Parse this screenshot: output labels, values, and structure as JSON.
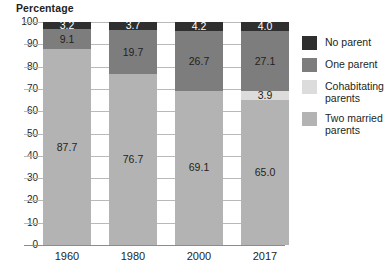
{
  "chart_data": {
    "type": "bar",
    "subtype": "stacked-100",
    "title": "Percentage",
    "xlabel": "",
    "ylabel": "",
    "ylim": [
      0,
      100
    ],
    "yticks": [
      0,
      10,
      20,
      30,
      40,
      50,
      60,
      70,
      80,
      90,
      100
    ],
    "ytick_labels": [
      "0",
      "10",
      "20",
      "30",
      "40",
      "50",
      "60",
      "70",
      "80",
      "90",
      "100"
    ],
    "grid": true,
    "legend_position": "right",
    "categories": [
      "1960",
      "1980",
      "2000",
      "2017"
    ],
    "series": [
      {
        "name": "No parent",
        "color": "#2f2f2f",
        "label_color": "#ffffff",
        "values": [
          3.2,
          3.7,
          4.2,
          4.0
        ],
        "value_labels": [
          "3.2",
          "3.7",
          "4.2",
          "4.0"
        ],
        "show_labels": [
          true,
          true,
          true,
          true
        ]
      },
      {
        "name": "One parent",
        "color": "#7d7d7d",
        "label_color": "#231f20",
        "values": [
          9.1,
          19.7,
          26.7,
          27.1
        ],
        "value_labels": [
          "9.1",
          "19.7",
          "26.7",
          "27.1"
        ],
        "show_labels": [
          true,
          true,
          true,
          true
        ]
      },
      {
        "name": "Cohabitating parents",
        "color": "#dcdcdc",
        "label_color": "#231f20",
        "values": [
          0.0,
          0.0,
          0.0,
          3.9
        ],
        "value_labels": [
          "",
          "",
          "",
          "3.9"
        ],
        "show_labels": [
          false,
          false,
          false,
          true
        ]
      },
      {
        "name": "Two married parents",
        "color": "#b3b3b3",
        "label_color": "#231f20",
        "values": [
          87.7,
          76.7,
          69.1,
          65.0
        ],
        "value_labels": [
          "87.7",
          "76.7",
          "69.1",
          "65.0"
        ],
        "show_labels": [
          true,
          true,
          true,
          true
        ]
      }
    ]
  },
  "legend": {
    "items": [
      {
        "label": "No parent",
        "color": "#2f2f2f"
      },
      {
        "label": "One parent",
        "color": "#7d7d7d"
      },
      {
        "label": "Cohabitating parents",
        "color": "#dcdcdc"
      },
      {
        "label": "Two married parents",
        "color": "#b3b3b3"
      }
    ]
  }
}
